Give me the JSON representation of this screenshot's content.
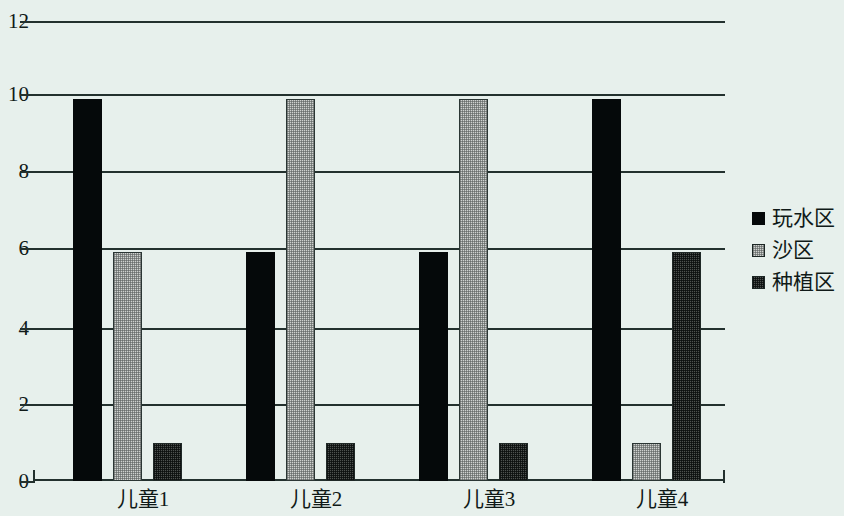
{
  "chart_data": {
    "type": "bar",
    "title": "",
    "subtitle": "",
    "xlabel": "",
    "ylabel": "",
    "categories": [
      "儿童1",
      "儿童2",
      "儿童3",
      "儿童4"
    ],
    "series": [
      {
        "name": "玩水区",
        "color": "#05090a",
        "values": [
          10,
          6,
          6,
          10
        ]
      },
      {
        "name": "沙区",
        "color": "#cfd2cf",
        "values": [
          6,
          10,
          10,
          1
        ]
      },
      {
        "name": "种植区",
        "color": "#4d5250",
        "values": [
          1,
          1,
          1,
          6
        ]
      }
    ],
    "ylim": [
      0,
      12
    ],
    "ytick_labels": [
      "0",
      "2",
      "4",
      "6",
      "8",
      "10",
      "12"
    ],
    "ytick_values": [
      0,
      2,
      4,
      6,
      8,
      10,
      12
    ],
    "grid": true,
    "legend_position": "right",
    "background_color": "#e7f0ec",
    "axis_color": "#23312e"
  },
  "legend": {
    "items": [
      {
        "label": "玩水区",
        "swatch": "legend-swatch-black"
      },
      {
        "label": "沙区",
        "swatch": "legend-swatch-light-gray"
      },
      {
        "label": "种植区",
        "swatch": "legend-swatch-dark-gray"
      }
    ]
  }
}
